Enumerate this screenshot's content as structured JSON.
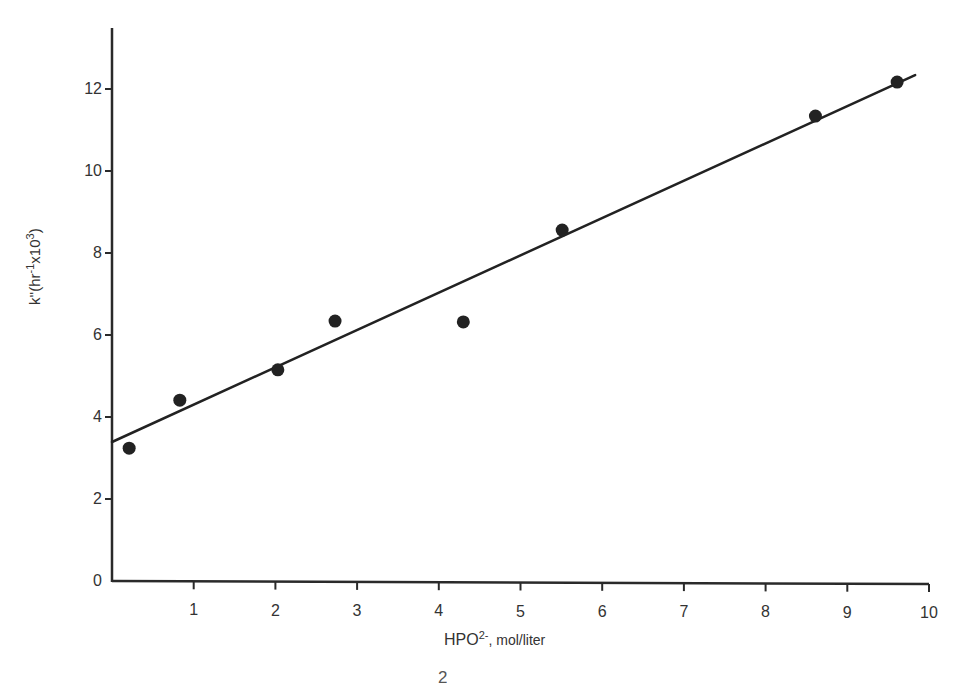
{
  "chart_data": {
    "type": "scatter",
    "title": "",
    "xlabel": "HPO2-, mol/liter",
    "ylabel": "k''(hr-1 x10^3)",
    "xlim": [
      0,
      10
    ],
    "ylim": [
      0,
      13.5
    ],
    "x_ticks": [
      "0",
      "1",
      "2",
      "3",
      "4",
      "5",
      "6",
      "7",
      "8",
      "9",
      "10"
    ],
    "y_ticks": [
      "0",
      "2",
      "4",
      "6",
      "8",
      "10",
      "12"
    ],
    "grid": false,
    "legend": null,
    "series": [
      {
        "name": "measured k''",
        "kind": "points",
        "x": [
          0.21,
          0.83,
          2.03,
          2.73,
          4.3,
          5.51,
          8.61,
          9.61
        ],
        "y": [
          3.24,
          4.41,
          5.15,
          6.34,
          6.32,
          8.56,
          11.34,
          12.17
        ]
      },
      {
        "name": "linear fit",
        "kind": "line",
        "x": [
          0,
          9.83
        ],
        "y": [
          3.39,
          12.34
        ]
      }
    ]
  },
  "labels": {
    "y_axis_prefix": "k''(hr",
    "y_axis_sup1": "-1",
    "y_axis_mid": "x10",
    "y_axis_sup2": "3",
    "y_axis_suffix": ")",
    "x_axis_main": "HPO",
    "x_axis_sup": "2-",
    "x_axis_unit": ", mol/liter",
    "clipped_caption_glyph": "2"
  }
}
